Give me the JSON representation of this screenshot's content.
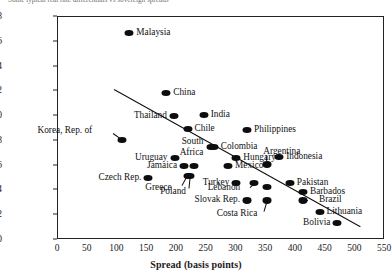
{
  "figure": {
    "clipped_title": "Some typical real rate differentials vs sovereign spreads",
    "background": "#ffffff",
    "marker_color": "#0d0d0d"
  },
  "chart_data": {
    "type": "scatter",
    "title": "",
    "xlabel": "Spread (basis points)",
    "ylabel": "",
    "xlim": [
      0,
      550
    ],
    "ylim": [
      0,
      18
    ],
    "xticks": [
      0,
      50,
      100,
      150,
      200,
      250,
      300,
      350,
      400,
      450,
      500,
      550
    ],
    "yticks": [
      0,
      2,
      4,
      6,
      8,
      10,
      12,
      14,
      16,
      18
    ],
    "grid": false,
    "legend": null,
    "trendline": {
      "type": "linear",
      "x_start": 95,
      "y_start": 12.2,
      "x_end": 510,
      "y_end": 1.1
    },
    "points": [
      {
        "label": "Malaysia",
        "x": 120,
        "y": 16.7,
        "label_side": "right"
      },
      {
        "label": "China",
        "x": 182,
        "y": 11.9,
        "label_side": "right"
      },
      {
        "label": "Thailand",
        "x": 195,
        "y": 10.0,
        "label_side": "left"
      },
      {
        "label": "India",
        "x": 245,
        "y": 10.1,
        "label_side": "right"
      },
      {
        "label": "Korea, Rep. of",
        "x": 108,
        "y": 8.1,
        "label_side": "left"
      },
      {
        "label": "Chile",
        "x": 218,
        "y": 9.0,
        "label_side": "right"
      },
      {
        "label": "Philippines",
        "x": 318,
        "y": 8.9,
        "label_side": "right"
      },
      {
        "label": "South Africa",
        "x": 258,
        "y": 7.5,
        "label_side": "left"
      },
      {
        "label": "Colombia",
        "x": 262,
        "y": 7.5,
        "label_side": "right"
      },
      {
        "label": "Uruguay",
        "x": 196,
        "y": 6.6,
        "label_side": "left"
      },
      {
        "label": "Hungary",
        "x": 300,
        "y": 6.6,
        "label_side": "right"
      },
      {
        "label": "Indonesia",
        "x": 372,
        "y": 6.7,
        "label_side": "right"
      },
      {
        "label": "Jamaica",
        "x": 212,
        "y": 6.0,
        "label_side": "left"
      },
      {
        "label": "Jamaica-2",
        "x": 228,
        "y": 6.0,
        "label_side": "none"
      },
      {
        "label": "Mexico",
        "x": 286,
        "y": 6.0,
        "label_side": "right"
      },
      {
        "label": "Argentina",
        "x": 352,
        "y": 6.1,
        "label_side": "right"
      },
      {
        "label": "Czech Rep.",
        "x": 152,
        "y": 5.0,
        "label_side": "left"
      },
      {
        "label": "Greece",
        "x": 218,
        "y": 5.2,
        "label_side": "left"
      },
      {
        "label": "Poland",
        "x": 222,
        "y": 5.2,
        "label_side": "left"
      },
      {
        "label": "Turkey",
        "x": 300,
        "y": 4.6,
        "label_side": "left"
      },
      {
        "label": "Lebanon",
        "x": 330,
        "y": 4.6,
        "label_side": "left"
      },
      {
        "label": "Pakistan",
        "x": 390,
        "y": 4.6,
        "label_side": "right"
      },
      {
        "label": "Argentina-pt",
        "x": 352,
        "y": 4.3,
        "label_side": "none"
      },
      {
        "label": "Barbados",
        "x": 412,
        "y": 3.9,
        "label_side": "right"
      },
      {
        "label": "Slovak Rep.",
        "x": 318,
        "y": 3.2,
        "label_side": "left"
      },
      {
        "label": "Costa Rica",
        "x": 352,
        "y": 3.2,
        "label_side": "left"
      },
      {
        "label": "Brazil",
        "x": 412,
        "y": 3.2,
        "label_side": "right"
      },
      {
        "label": "Lithuania",
        "x": 440,
        "y": 2.3,
        "label_side": "right"
      },
      {
        "label": "Bolivia",
        "x": 470,
        "y": 1.4,
        "label_side": "left"
      }
    ]
  }
}
